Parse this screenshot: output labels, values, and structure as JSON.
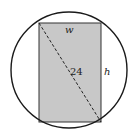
{
  "diagram": {
    "type": "inscribed-rectangle-in-circle",
    "circle": {
      "cx": 69,
      "cy": 70,
      "r": 58,
      "stroke": "#1a1a1a"
    },
    "rectangle": {
      "x": 39,
      "y": 23,
      "width": 62,
      "height": 99,
      "fill": "#c8c8c8",
      "stroke": "#333333"
    },
    "diagonal": {
      "x1": 39,
      "y1": 23,
      "x2": 101,
      "y2": 122,
      "style": "dashed"
    },
    "labels": {
      "width": "w",
      "height": "h",
      "diagonal": "24"
    }
  }
}
